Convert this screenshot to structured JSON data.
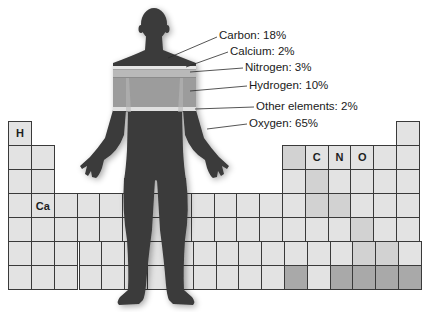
{
  "diagram": {
    "colors": {
      "silhouette": "#3b3b3b",
      "cell_default": "#e3e3e3",
      "cell_medium": "#d2d2d2",
      "cell_dark": "#a9a9a9",
      "grid_line": "#3a3a3a",
      "band_light": "#e6e6e6",
      "band_nitrogen": "#b9b9b9",
      "band_hydrogen": "#9c9c9c"
    },
    "callouts": [
      {
        "element": "Carbon",
        "percent": "18%",
        "label": "Carbon: 18%"
      },
      {
        "element": "Calcium",
        "percent": "2%",
        "label": "Calcium: 2%"
      },
      {
        "element": "Nitrogen",
        "percent": "3%",
        "label": "Nitrogen: 3%"
      },
      {
        "element": "Hydrogen",
        "percent": "10%",
        "label": "Hydrogen: 10%"
      },
      {
        "element": "Other elements",
        "percent": "2%",
        "label": "Other elements: 2%"
      },
      {
        "element": "Oxygen",
        "percent": "65%",
        "label": "Oxygen: 65%"
      }
    ],
    "periodic_table": {
      "labeled_cells": [
        {
          "symbol": "H",
          "row": 1,
          "col": 1
        },
        {
          "symbol": "Ca",
          "row": 4,
          "col": 2
        },
        {
          "symbol": "C",
          "row": 2,
          "col": 14
        },
        {
          "symbol": "N",
          "row": 2,
          "col": 15
        },
        {
          "symbol": "O",
          "row": 2,
          "col": 16
        }
      ]
    }
  },
  "chart_data": {
    "type": "pie",
    "categories": [
      "Oxygen",
      "Carbon",
      "Hydrogen",
      "Nitrogen",
      "Calcium",
      "Other elements"
    ],
    "values": [
      65,
      18,
      10,
      3,
      2,
      2
    ],
    "unit": "%"
  }
}
